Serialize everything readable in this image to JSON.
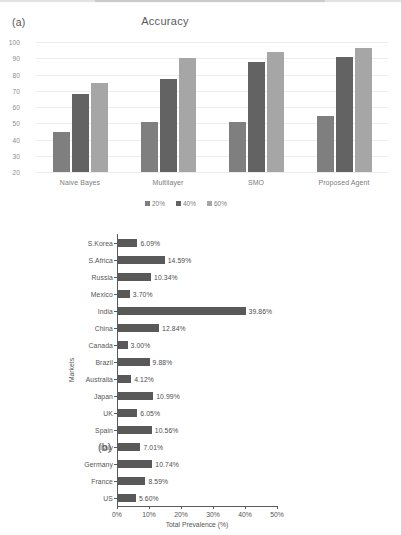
{
  "figure": {
    "panel_a_tag": "(a)",
    "panel_b_tag": "(b)"
  },
  "chart_data": [
    {
      "type": "bar",
      "panel": "(a)",
      "title": "Accuracy",
      "xlabel": "",
      "ylabel": "",
      "ylim": [
        20,
        100
      ],
      "yticks": [
        "100",
        "90",
        "80",
        "70",
        "60",
        "50",
        "40",
        "30",
        "20"
      ],
      "grid": true,
      "legend_position": "bottom",
      "categories": [
        "Naive Bayes",
        "Multilayer",
        "SMO",
        "Proposed Agent"
      ],
      "series": [
        {
          "name": "20%",
          "color": "#7f7f7f",
          "values": [
            44.5,
            51,
            51,
            54.5
          ]
        },
        {
          "name": "40%",
          "color": "#636363",
          "values": [
            68,
            77.5,
            87.5,
            91
          ]
        },
        {
          "name": "60%",
          "color": "#a6a6a6",
          "values": [
            75,
            90,
            94,
            96.5
          ]
        }
      ]
    },
    {
      "type": "bar",
      "panel": "(b)",
      "orientation": "horizontal",
      "title": "",
      "xlabel": "Total Prevalence (%)",
      "ylabel": "Markets",
      "xlim": [
        0,
        50
      ],
      "xticks": [
        "0%",
        "10%",
        "20%",
        "30%",
        "40%",
        "50%"
      ],
      "bar_color": "#595959",
      "grid": false,
      "categories": [
        "S.Korea",
        "S.Africa",
        "Russia",
        "Mexico",
        "India",
        "China",
        "Canada",
        "Brazil",
        "Australia",
        "Japan",
        "UK",
        "Spain",
        "Italy",
        "Germany",
        "France",
        "US"
      ],
      "values": [
        6.09,
        14.59,
        10.34,
        3.7,
        39.86,
        12.84,
        3.0,
        9.88,
        4.12,
        10.99,
        6.05,
        10.56,
        7.01,
        10.74,
        8.59,
        5.6
      ],
      "data_labels": [
        "6.09%",
        "14.59%",
        "10.34%",
        "3.70%",
        "39.86%",
        "12.84%",
        "3.00%",
        "9.88%",
        "4.12%",
        "10.99%",
        "6.05%",
        "10.56%",
        "7.01%",
        "10.74%",
        "8.59%",
        "5.60%"
      ]
    }
  ]
}
